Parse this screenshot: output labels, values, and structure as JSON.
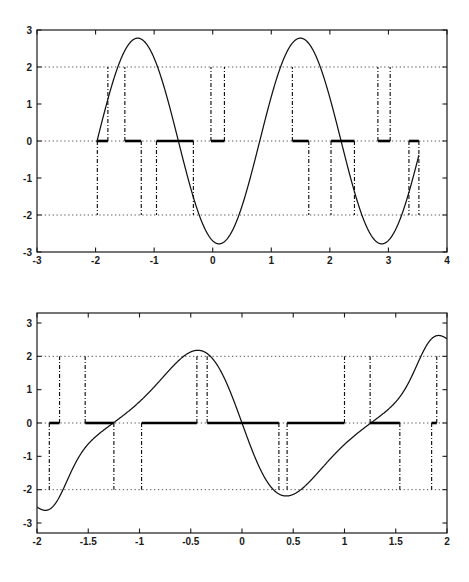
{
  "figure": {
    "kind": "two-stacked-line-plots",
    "background_color": "#ffffff",
    "axis_color": "#1a1a1a",
    "curve_color": "#111111",
    "grid_color": "#555555",
    "thick_segment_color": "#000000"
  },
  "chart_data": [
    {
      "id": "top-plot",
      "type": "line",
      "title": "",
      "subtitle": "",
      "xlabel": "",
      "ylabel": "",
      "xlim": [
        -3,
        4
      ],
      "ylim": [
        -3,
        3
      ],
      "grid": true,
      "grid_style": "dotted",
      "grid_y_values": [
        -2,
        0,
        2
      ],
      "legend": "none",
      "x_ticks": [
        -3,
        -2,
        -1,
        0,
        1,
        2,
        3,
        4
      ],
      "x_tick_labels": [
        "-3",
        "-2",
        "-1",
        "0",
        "1",
        "2",
        "3",
        "4"
      ],
      "y_ticks": [
        -3,
        -2,
        -1,
        0,
        1,
        2,
        3
      ],
      "y_tick_labels": [
        "-3",
        "-2",
        "-1",
        "0",
        "1",
        "2",
        "3"
      ],
      "series": [
        {
          "name": "signal",
          "style": "solid",
          "description": "oscillating sinusoid, amplitude about 2.5 to 3, period about 2.8",
          "formula": "2.78*sin(2.26*(x+1.97))",
          "x_start": -1.98,
          "x_end": 3.52
        },
        {
          "name": "dead-zone-output",
          "style": "thick-solid-at-zero",
          "description": "thick horizontal segments at y = 0 where |signal| < 2",
          "segments": [
            [
              -1.97,
              -1.79
            ],
            [
              -1.5,
              -1.22
            ],
            [
              -0.96,
              -0.33
            ],
            [
              -0.03,
              0.2
            ],
            [
              1.36,
              1.64
            ],
            [
              2.02,
              2.42
            ],
            [
              2.82,
              3.03
            ],
            [
              3.35,
              3.52
            ]
          ]
        },
        {
          "name": "threshold-markers",
          "style": "dash-dot-vertical",
          "description": "vertical dash-dot lines from y = 0 to the +/-2 crossing of the signal",
          "x_positions": [
            -1.97,
            -1.79,
            -1.5,
            -1.22,
            -0.96,
            -0.33,
            -0.03,
            0.2,
            1.36,
            1.64,
            2.02,
            2.42,
            2.82,
            3.03,
            3.35,
            3.52
          ],
          "levels": [
            -2,
            2,
            2,
            -2,
            -2,
            -2,
            2,
            2,
            2,
            -2,
            -2,
            -2,
            2,
            2,
            -2,
            -2
          ]
        }
      ]
    },
    {
      "id": "bottom-plot",
      "type": "line",
      "title": "",
      "subtitle": "",
      "xlabel": "",
      "ylabel": "",
      "xlim": [
        -2,
        2
      ],
      "ylim": [
        -3.3,
        3.3
      ],
      "grid": true,
      "grid_style": "dotted",
      "grid_y_values": [
        -2,
        0,
        2
      ],
      "legend": "none",
      "x_ticks": [
        -2,
        -1.5,
        -1,
        -0.5,
        0,
        0.5,
        1,
        1.5,
        2
      ],
      "x_tick_labels": [
        "-2",
        "-1.5",
        "-1",
        "-0.5",
        "0",
        "0.5",
        "1",
        "1.5",
        "2"
      ],
      "y_ticks": [
        -3,
        -2,
        -1,
        0,
        1,
        2,
        3
      ],
      "y_tick_labels": [
        "-3",
        "-2",
        "-1",
        "0",
        "1",
        "2",
        "3"
      ],
      "series": [
        {
          "name": "chirp-signal",
          "style": "solid",
          "description": "frequency modulated oscillation, amplitude varies 2.0 to 2.4, clipped by axes",
          "x_start": -2.0,
          "x_end": 2.0
        },
        {
          "name": "dead-zone-output",
          "style": "thick-solid-at-zero",
          "description": "thick horizontal segments at y = 0 where |signal| < 2",
          "segments": [
            [
              -1.88,
              -1.78
            ],
            [
              -1.53,
              -1.25
            ],
            [
              -0.98,
              -0.44
            ],
            [
              -0.34,
              0.36
            ],
            [
              0.44,
              1.0
            ],
            [
              1.25,
              1.54
            ],
            [
              1.85,
              1.9
            ]
          ]
        },
        {
          "name": "threshold-markers",
          "style": "dash-dot-vertical",
          "description": "vertical dash-dot lines from y = 0 to the +/-2 crossing of the signal",
          "x_positions": [
            -1.88,
            -1.78,
            -1.53,
            -1.25,
            -0.98,
            -0.44,
            -0.34,
            0.36,
            0.44,
            1.0,
            1.25,
            1.54,
            1.85,
            1.9
          ],
          "levels": [
            -2,
            2,
            2,
            -2,
            -2,
            2,
            2,
            -2,
            -2,
            2,
            2,
            -2,
            -2,
            2
          ]
        }
      ]
    }
  ]
}
